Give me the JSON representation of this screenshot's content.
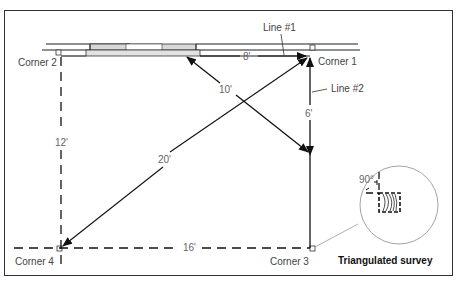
{
  "diagram": {
    "caption": "Triangulated survey",
    "corners": [
      {
        "id": "corner-1",
        "label": "Corner 1"
      },
      {
        "id": "corner-2",
        "label": "Corner 2"
      },
      {
        "id": "corner-3",
        "label": "Corner 3"
      },
      {
        "id": "corner-4",
        "label": "Corner 4"
      }
    ],
    "lines": [
      {
        "id": "line-1",
        "label": "Line #1"
      },
      {
        "id": "line-2",
        "label": "Line #2"
      }
    ],
    "dimensions": {
      "top_segment": "8'",
      "door_diagonal": "10'",
      "right_segment": "6'",
      "left_side": "12'",
      "main_diagonal": "20'",
      "bottom_side": "16'"
    },
    "detail": {
      "angle": "90°"
    },
    "colors": {
      "line": "#111111",
      "text": "#444444",
      "frame": "#333333",
      "door_fill": "#d8d8d8"
    }
  }
}
